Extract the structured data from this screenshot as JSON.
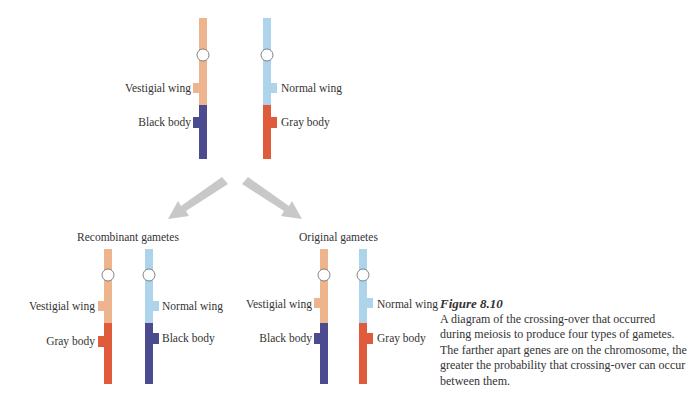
{
  "colors": {
    "vestigial_segment": "#eeb48e",
    "normal_segment": "#aed4ec",
    "black_body": "#4d4b8f",
    "gray_body": "#e05a3c",
    "arrow": "#c8c8c8",
    "centromere": "#ffffff"
  },
  "parent": {
    "left": {
      "wing_label": "Vestigial wing",
      "body_label": "Black body"
    },
    "right": {
      "wing_label": "Normal wing",
      "body_label": "Gray body"
    }
  },
  "recombinant": {
    "heading": "Recombinant gametes",
    "left": {
      "wing_label": "Vestigial wing",
      "body_label": "Gray body"
    },
    "right": {
      "wing_label": "Normal wing",
      "body_label": "Black body"
    }
  },
  "original": {
    "heading": "Original gametes",
    "left": {
      "wing_label": "Vestigial wing",
      "body_label": "Black body"
    },
    "right": {
      "wing_label": "Normal wing",
      "body_label": "Gray body"
    }
  },
  "caption": {
    "title": "Figure 8.10",
    "text": "A diagram of the crossing-over that occurred during meiosis to produce four types of gametes. The farther apart genes are on the chromosome, the greater the probability that crossing-over can occur between them."
  }
}
